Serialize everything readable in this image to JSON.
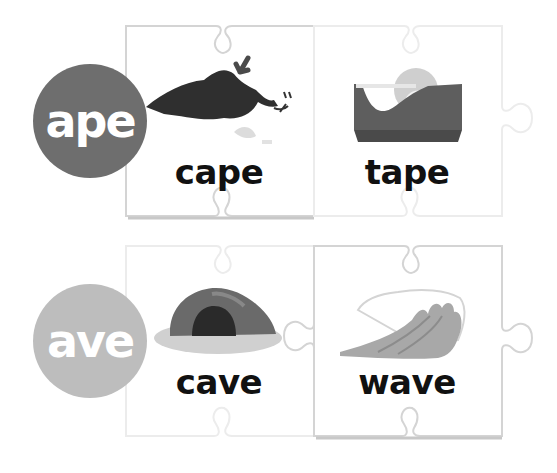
{
  "rows": [
    {
      "family": "ape",
      "circle_color": "#6e6e6e",
      "cards": [
        {
          "word": "cape",
          "icon": "cape-icon"
        },
        {
          "word": "tape",
          "icon": "tape-dispenser-icon"
        }
      ]
    },
    {
      "family": "ave",
      "circle_color": "#bdbdbd",
      "cards": [
        {
          "word": "cave",
          "icon": "cave-icon"
        },
        {
          "word": "wave",
          "icon": "wave-icon"
        }
      ]
    }
  ],
  "colors": {
    "piece_border": "#d6d6d6",
    "piece_shadow": "#c8c8c8",
    "text": "#111111"
  }
}
